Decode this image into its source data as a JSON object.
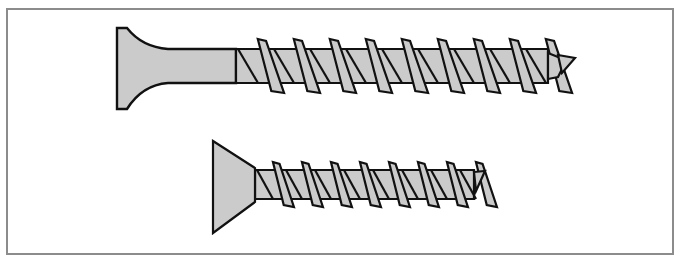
{
  "figure": {
    "frame_color": "#8c8c8c",
    "fill_color": "#cbcbcb",
    "stroke_color": "#111111",
    "screws": [
      {
        "name": "long-screw",
        "head": {
          "left": 117,
          "top": 28,
          "bottom": 109,
          "neck_x": 160
        },
        "shank": {
          "top": 49,
          "bottom": 83,
          "unthreaded_end": 236,
          "thread_end": 548
        },
        "tip": {
          "x": 575,
          "y": 58
        },
        "thread_pitch": 36,
        "thread_start": 238
      },
      {
        "name": "short-screw",
        "head": {
          "left": 213,
          "top": 141,
          "bottom": 233,
          "right": 255
        },
        "shank": {
          "top": 170,
          "bottom": 199,
          "unthreaded_end": 255,
          "thread_end": 474
        },
        "tip": {
          "x": 485,
          "y": 172
        },
        "thread_pitch": 29,
        "thread_start": 257
      }
    ]
  }
}
